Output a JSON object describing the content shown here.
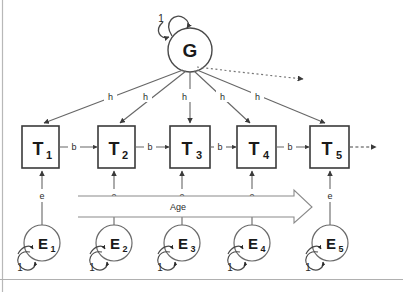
{
  "diagram": {
    "colors": {
      "stroke": "#555555",
      "node_stroke": "#3a3a3a",
      "text": "#1a1a1a",
      "background": "#ffffff",
      "border": "#9a9a9a"
    },
    "latent_common": {
      "id": "G",
      "label": "G",
      "self_loop_label": "1"
    },
    "trait_nodes": [
      {
        "label": "T",
        "subscript": "1"
      },
      {
        "label": "T",
        "subscript": "2"
      },
      {
        "label": "T",
        "subscript": "3"
      },
      {
        "label": "T",
        "subscript": "4"
      },
      {
        "label": "T",
        "subscript": "5"
      }
    ],
    "error_nodes": [
      {
        "label": "E",
        "subscript": "1",
        "self_loop_label": "1"
      },
      {
        "label": "E",
        "subscript": "2",
        "self_loop_label": "1"
      },
      {
        "label": "E",
        "subscript": "3",
        "self_loop_label": "1"
      },
      {
        "label": "E",
        "subscript": "4",
        "self_loop_label": "1"
      },
      {
        "label": "E",
        "subscript": "5",
        "self_loop_label": "1"
      }
    ],
    "common_path_labels": [
      "h",
      "h",
      "h",
      "h",
      "h"
    ],
    "autoregressive_labels": [
      "b",
      "b",
      "b",
      "b"
    ],
    "error_path_labels": [
      "e",
      "e",
      "e",
      "e",
      "e"
    ],
    "axis_arrow": {
      "label": "Age"
    }
  }
}
